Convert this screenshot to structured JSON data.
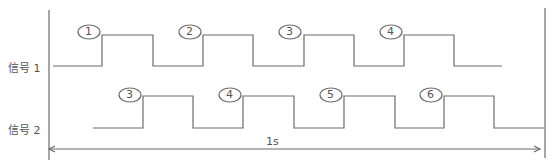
{
  "signals": [
    {
      "label": "信号 1",
      "pulses": [
        "1",
        "2",
        "3",
        "4"
      ]
    },
    {
      "label": "信号 2",
      "pulses": [
        "3",
        "4",
        "5",
        "6"
      ]
    }
  ],
  "duration_label": "1s",
  "colors": {
    "line": "#6b6b6b",
    "text": "#555555"
  }
}
